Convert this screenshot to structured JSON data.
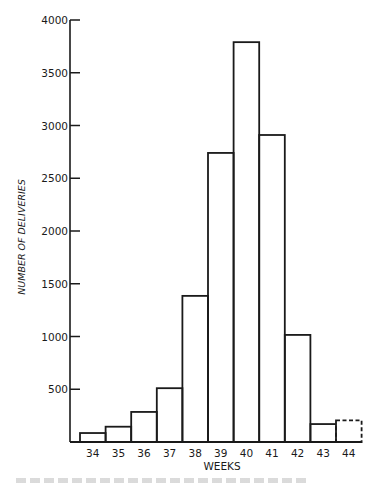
{
  "chart_data": {
    "type": "bar",
    "title": "",
    "xlabel": "WEEKS",
    "ylabel": "NUMBER OF DELIVERIES",
    "categories": [
      "34",
      "35",
      "36",
      "37",
      "38",
      "39",
      "40",
      "41",
      "42",
      "43",
      "44"
    ],
    "values": [
      85,
      145,
      285,
      510,
      1385,
      2740,
      3790,
      2910,
      1015,
      170,
      205
    ],
    "dashed_categories": [
      "44"
    ],
    "yticks": [
      500,
      1000,
      1500,
      2000,
      2500,
      3000,
      3500,
      4000
    ],
    "ytick_labels": [
      "500",
      "1000",
      "1500",
      "2000",
      "2500",
      "3000",
      "3500",
      "4000"
    ],
    "ylim": [
      0,
      4000
    ],
    "grid": false,
    "legend": null,
    "bar_style": "outline"
  },
  "colors": {
    "ink": "#1a1a1a",
    "background": "#ffffff"
  }
}
